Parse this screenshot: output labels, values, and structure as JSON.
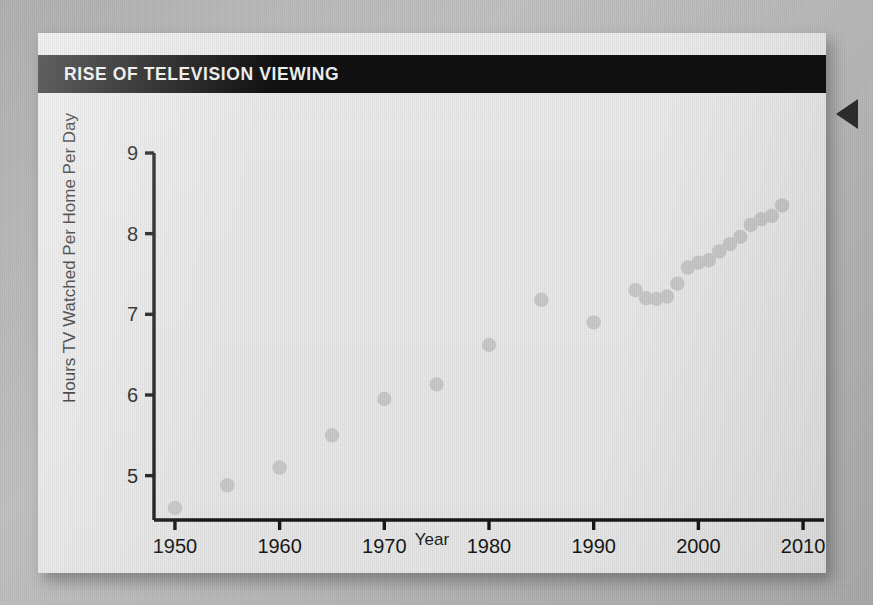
{
  "figure": {
    "title": "RISE OF TELEVISION VIEWING",
    "marker_color": "#c9c9c9",
    "axis_color": "#151515",
    "title_band_color": "#0d0d0d",
    "card_color": "#ececed"
  },
  "chart_data": {
    "type": "scatter",
    "title": "RISE OF TELEVISION VIEWING",
    "xlabel": "Year",
    "ylabel": "Hours TV Watched Per Home Per Day",
    "xlim": [
      1948,
      2012
    ],
    "ylim": [
      4.45,
      9.0
    ],
    "xticks": [
      1950,
      1960,
      1970,
      1980,
      1990,
      2000,
      2010
    ],
    "xtick_labels": [
      "1950",
      "1960",
      "1970",
      "1980",
      "1990",
      "2000",
      "2010"
    ],
    "yticks": [
      5,
      6,
      7,
      8,
      9
    ],
    "ytick_labels": [
      "5",
      "6",
      "7",
      "8",
      "9"
    ],
    "grid": false,
    "legend": null,
    "series": [
      {
        "name": "Hours TV watched per home per day",
        "x": [
          1950,
          1955,
          1960,
          1965,
          1970,
          1975,
          1980,
          1985,
          1990,
          1994,
          1995,
          1996,
          1997,
          1998,
          1999,
          2000,
          2001,
          2002,
          2003,
          2004,
          2005,
          2006,
          2007,
          2008
        ],
        "y": [
          4.6,
          4.88,
          5.1,
          5.5,
          5.95,
          6.13,
          6.62,
          7.18,
          6.9,
          7.3,
          7.2,
          7.19,
          7.22,
          7.38,
          7.58,
          7.64,
          7.67,
          7.78,
          7.87,
          7.96,
          8.11,
          8.18,
          8.22,
          8.35
        ]
      }
    ]
  },
  "annotations": {
    "edge_marker": "left-pointing-triangle"
  }
}
